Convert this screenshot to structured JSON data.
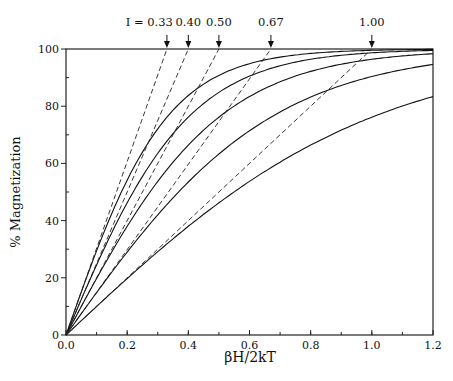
{
  "chart_data": {
    "type": "line",
    "title": "",
    "xlabel": "βH/2kT",
    "ylabel": "% Magnetization",
    "xlim": [
      0.0,
      1.2
    ],
    "ylim": [
      0,
      100
    ],
    "xticks": [
      0.0,
      0.2,
      0.4,
      0.6,
      0.8,
      1.0,
      1.2
    ],
    "xtick_labels": [
      "0.0",
      "0.2",
      "0.4",
      "0.6",
      "0.8",
      "1.0",
      "1.2"
    ],
    "xminor_step": 0.1,
    "yticks": [
      0,
      20,
      40,
      60,
      80,
      100
    ],
    "ytick_labels": [
      "0",
      "20",
      "40",
      "60",
      "80",
      "100"
    ],
    "yminor_step": 10,
    "grid": false,
    "legend": "none",
    "annotation_prefix": "I = ",
    "series": [
      {
        "name": "I = 0.33",
        "I": 0.33,
        "label": "0.33",
        "x": [
          0,
          0.1,
          0.2,
          0.3,
          0.4,
          0.5,
          0.6,
          0.8,
          1.0,
          1.2
        ],
        "values": [
          0,
          29.3,
          54.6,
          73.3,
          85.2,
          92.2,
          95.8,
          99.2,
          99.9,
          100
        ],
        "tangent_end_x": 0.33
      },
      {
        "name": "I = 0.40",
        "I": 0.4,
        "label": "0.40",
        "x": [
          0,
          0.1,
          0.2,
          0.3,
          0.4,
          0.5,
          0.6,
          0.8,
          1.0,
          1.2
        ],
        "values": [
          0,
          24.5,
          46.2,
          63.5,
          76.2,
          84.8,
          90.5,
          96.4,
          98.7,
          99.5
        ],
        "tangent_end_x": 0.4
      },
      {
        "name": "I = 0.50",
        "I": 0.5,
        "label": "0.50",
        "x": [
          0,
          0.1,
          0.2,
          0.3,
          0.4,
          0.5,
          0.6,
          0.8,
          1.0,
          1.2
        ],
        "values": [
          0,
          19.7,
          38.0,
          53.7,
          66.4,
          76.2,
          83.4,
          92.2,
          96.4,
          98.4
        ],
        "tangent_end_x": 0.5
      },
      {
        "name": "I = 0.67",
        "I": 0.67,
        "label": "0.67",
        "x": [
          0,
          0.1,
          0.2,
          0.3,
          0.4,
          0.5,
          0.6,
          0.8,
          1.0,
          1.2
        ],
        "values": [
          0,
          14.8,
          29.0,
          42.0,
          53.5,
          63.2,
          71.2,
          83.1,
          90.3,
          94.6
        ],
        "tangent_end_x": 0.67
      },
      {
        "name": "I = 1.00",
        "I": 1.0,
        "label": "1.00",
        "x": [
          0,
          0.1,
          0.2,
          0.3,
          0.4,
          0.5,
          0.6,
          0.8,
          1.0,
          1.2
        ],
        "values": [
          0,
          10.0,
          19.7,
          29.1,
          38.0,
          46.2,
          53.7,
          66.4,
          76.2,
          83.4
        ],
        "tangent_end_x": 1.0
      }
    ],
    "tangent_lines": "dashed lines from origin to (I, 100) for each series"
  }
}
